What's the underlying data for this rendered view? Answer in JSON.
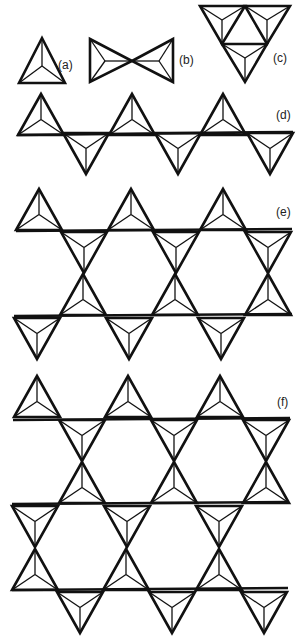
{
  "figure": {
    "colors": {
      "stroke": "#111111",
      "background": "#ffffff"
    },
    "panels": [
      {
        "id": "a",
        "label": "(a)",
        "caption": "single tetrahedron"
      },
      {
        "id": "b",
        "label": "(b)",
        "caption": "two corner-sharing tetrahedra"
      },
      {
        "id": "c",
        "label": "(c)",
        "caption": "three tetrahedra cluster"
      },
      {
        "id": "d",
        "label": "(d)",
        "caption": "single chain"
      },
      {
        "id": "e",
        "label": "(e)",
        "caption": "double chain"
      },
      {
        "id": "f",
        "label": "(f)",
        "caption": "sheet"
      }
    ]
  }
}
